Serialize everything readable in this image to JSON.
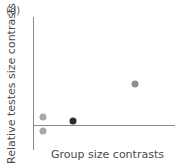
{
  "panel": {
    "label": "(d)"
  },
  "chart_data": {
    "type": "scatter",
    "title": "(d)",
    "xlabel": "Group size contrasts",
    "ylabel": "Relative testes size contrasts",
    "grid": false,
    "legend": null,
    "axes": {
      "x_axis_visible": true,
      "y_axis_visible": true,
      "x_tick_labels": [],
      "y_tick_labels": [],
      "zero_reference_line": true,
      "xlim": [
        0,
        1
      ],
      "ylim": [
        -0.25,
        1
      ]
    },
    "points": [
      {
        "x": 0.07,
        "y": 0.08,
        "color": "#a8a8a8",
        "size": 7
      },
      {
        "x": 0.07,
        "y": -0.06,
        "color": "#a8a8a8",
        "size": 7
      },
      {
        "x": 0.28,
        "y": 0.035,
        "color": "#2b2b2b",
        "size": 7
      },
      {
        "x": 0.72,
        "y": 0.39,
        "color": "#8f8f8f",
        "size": 7
      }
    ],
    "colors": {
      "axis": "#8a8a8a",
      "label_text": "#4a4a4a",
      "panel_label_text": "#5a5a5a",
      "background": "#ffffff"
    }
  }
}
